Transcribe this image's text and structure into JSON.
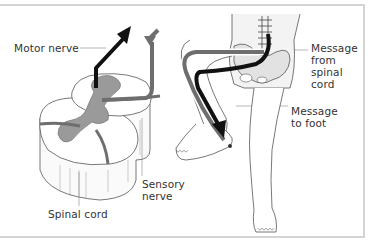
{
  "diagram": {
    "colors": {
      "frame": "#d4d4d4",
      "motor_arrow": "#111111",
      "sensory_arrow": "#6e6e6e",
      "grey_matter": "#9a9a9a",
      "line": "#444444"
    },
    "labels": {
      "motor_nerve": "Motor nerve",
      "sensory_nerve": "Sensory\nnerve",
      "spinal_cord": "Spinal cord",
      "message_from_spinal_cord": "Message\nfrom\nspinal\ncord",
      "message_to_foot": "Message\nto foot"
    },
    "icons": {
      "motor_arrow": "up-arrow-icon",
      "sensory_arrow": "down-arrow-icon",
      "foot_arrow": "down-arrow-icon"
    }
  }
}
